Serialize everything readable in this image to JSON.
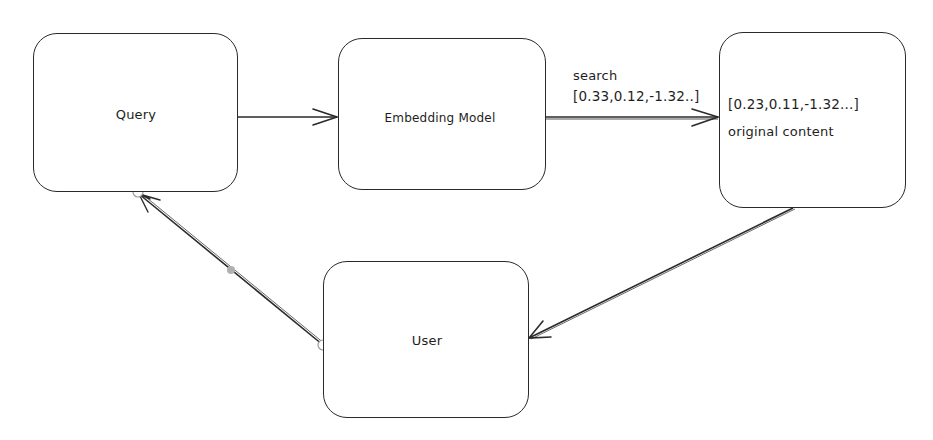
{
  "diagram": {
    "nodes": [
      {
        "id": "query",
        "label": "Query"
      },
      {
        "id": "embedding_model",
        "label": "Embedding Model"
      },
      {
        "id": "vector_store",
        "lines": [
          "[0.23,0.11,-1.32...]",
          "original content"
        ]
      },
      {
        "id": "user",
        "label": "User"
      }
    ],
    "edges": [
      {
        "from": "query",
        "to": "embedding_model",
        "label": ""
      },
      {
        "from": "embedding_model",
        "to": "vector_store",
        "label_lines": [
          "search",
          "[0.33,0.12,-1.32..]"
        ]
      },
      {
        "from": "vector_store",
        "to": "user",
        "label": ""
      },
      {
        "from": "user",
        "to": "query",
        "label": ""
      }
    ],
    "colors": {
      "stroke": "#2a2a2a",
      "background": "#ffffff",
      "handle_mid": "#b0b0b0"
    }
  }
}
